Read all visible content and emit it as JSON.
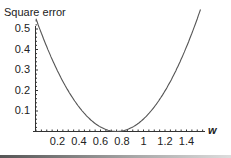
{
  "chart_data": {
    "type": "line",
    "title": "Square error",
    "xlabel": "w",
    "ylabel": "",
    "x_ticks": [
      "0.2",
      "0.4",
      "0.6",
      "0.8",
      "1",
      "1.2",
      "1.4"
    ],
    "y_ticks": [
      "0.1",
      "0.2",
      "0.3",
      "0.4",
      "0.5"
    ],
    "xlim": [
      0,
      1.55
    ],
    "ylim": [
      0,
      0.55
    ],
    "grid": false,
    "legend": null,
    "series": [
      {
        "name": "Square error",
        "x": [
          0.0,
          0.1,
          0.2,
          0.3,
          0.4,
          0.5,
          0.6,
          0.7,
          0.75,
          0.8,
          0.9,
          1.0,
          1.1,
          1.2,
          1.3,
          1.4,
          1.5
        ],
        "values": [
          0.55,
          0.41,
          0.3,
          0.2,
          0.12,
          0.06,
          0.02,
          0.0,
          0.0,
          0.0,
          0.02,
          0.06,
          0.12,
          0.2,
          0.3,
          0.41,
          0.55
        ]
      }
    ],
    "color": "#555555"
  }
}
